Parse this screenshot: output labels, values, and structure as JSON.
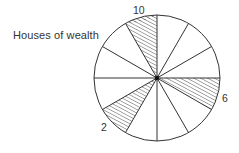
{
  "diagram": {
    "title": "Houses of wealth",
    "type": "wheel",
    "sector_count": 12,
    "highlighted_sectors": [
      {
        "label": "10",
        "start_angle_deg": 90,
        "end_angle_deg": 120
      },
      {
        "label": "6",
        "start_angle_deg": -30,
        "end_angle_deg": 0
      },
      {
        "label": "2",
        "start_angle_deg": 210,
        "end_angle_deg": 240
      }
    ],
    "colors": {
      "stroke": "#333333",
      "hatch": "#444444",
      "background": "#ffffff"
    }
  },
  "labels": {
    "caption": "Houses of wealth",
    "sector_10": "10",
    "sector_6": "6",
    "sector_2": "2"
  }
}
